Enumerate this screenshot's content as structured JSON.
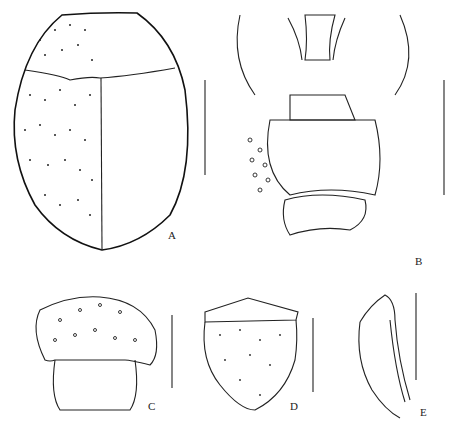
{
  "figure": {
    "panels": [
      {
        "id": "A",
        "label": "A",
        "subject": "body dorsal view"
      },
      {
        "id": "B",
        "label": "B",
        "subject": "thorax ventral view"
      },
      {
        "id": "C",
        "label": "C",
        "subject": "head"
      },
      {
        "id": "D",
        "label": "D",
        "subject": "elytron / plate"
      },
      {
        "id": "E",
        "label": "E",
        "subject": "leg segment lateral"
      }
    ],
    "scale_bars": 5,
    "colors": {
      "ink": "#222222",
      "background": "#ffffff"
    }
  }
}
